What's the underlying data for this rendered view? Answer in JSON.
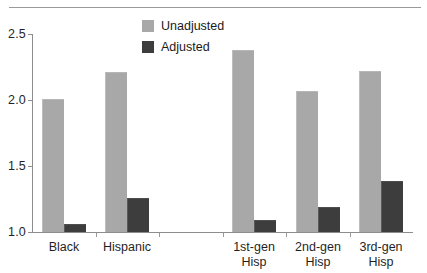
{
  "chart_data": {
    "type": "bar",
    "title": "",
    "subtitle": "",
    "xlabel": "",
    "ylabel": "",
    "ylim": [
      1.0,
      2.5
    ],
    "ytick_labels": [
      "2.5",
      "2.0",
      "1.5",
      "1.0"
    ],
    "ytick_values": [
      2.5,
      2.0,
      1.5,
      1.0
    ],
    "grid": false,
    "legend_position": "top-center",
    "categories": [
      "Black",
      "Hispanic",
      "1st-gen Hisp",
      "2nd-gen Hisp",
      "3rd-gen Hisp"
    ],
    "category_lines": [
      [
        "Black"
      ],
      [
        "Hispanic"
      ],
      [
        "1st-gen",
        "Hisp"
      ],
      [
        "2nd-gen",
        "Hisp"
      ],
      [
        "3rd-gen",
        "Hisp"
      ]
    ],
    "series": [
      {
        "name": "Unadjusted",
        "color": "#a8a8a8",
        "values": [
          2.01,
          2.21,
          2.38,
          2.07,
          2.22
        ]
      },
      {
        "name": "Adjusted",
        "color": "#3d3d3d",
        "values": [
          1.06,
          1.26,
          1.09,
          1.19,
          1.39
        ]
      }
    ],
    "annotations": []
  },
  "legend": {
    "items": [
      {
        "label": "Unadjusted",
        "color": "#a8a8a8",
        "swatch": "legend-swatch-unadjusted"
      },
      {
        "label": "Adjusted",
        "color": "#3d3d3d",
        "swatch": "legend-swatch-adjusted"
      }
    ]
  },
  "decor": {
    "top_rule_color": "#9a9a9a",
    "axis_color": "#8d8d8d"
  }
}
